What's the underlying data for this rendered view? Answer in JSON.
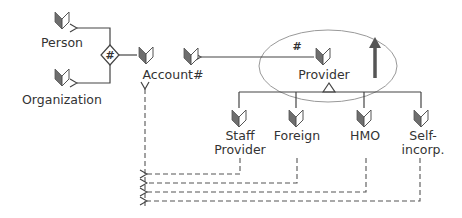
{
  "diagram": {
    "type": "class-hierarchy",
    "colors": {
      "line": "#444444",
      "icon_dark": "#6e6e6e",
      "icon_light": "#ffffff",
      "ellipse": "#888888",
      "text": "#333333"
    },
    "nodes": [
      {
        "id": "person",
        "label": "Person",
        "icon": "book-icon"
      },
      {
        "id": "organization",
        "label": "Organization",
        "icon": "book-icon"
      },
      {
        "id": "account",
        "label": "Account#",
        "icon": "book-icon"
      },
      {
        "id": "unlabeled",
        "label": "",
        "icon": "book-icon"
      },
      {
        "id": "provider",
        "label": "Provider",
        "icon": "book-icon"
      },
      {
        "id": "staff_provider",
        "label_line1": "Staff",
        "label_line2": "Provider",
        "icon": "book-icon"
      },
      {
        "id": "foreign",
        "label": "Foreign",
        "icon": "book-icon"
      },
      {
        "id": "hmo",
        "label": "HMO",
        "icon": "book-icon"
      },
      {
        "id": "self_incorp",
        "label_line1": "Self-",
        "label_line2": "incorp.",
        "icon": "book-icon"
      }
    ],
    "markers": {
      "diamond_hash": "#",
      "provider_hash": "#"
    },
    "edges": [
      {
        "from": "diamond",
        "to": "person",
        "style": "solid-arrow"
      },
      {
        "from": "diamond",
        "to": "organization",
        "style": "solid-arrow"
      },
      {
        "from": "account",
        "to": "diamond",
        "style": "solid"
      },
      {
        "from": "provider",
        "to": "unlabeled",
        "style": "solid-arrow",
        "marker": "#"
      },
      {
        "from": "staff_provider",
        "to": "provider",
        "style": "inheritance"
      },
      {
        "from": "foreign",
        "to": "provider",
        "style": "inheritance"
      },
      {
        "from": "hmo",
        "to": "provider",
        "style": "inheritance"
      },
      {
        "from": "self_incorp",
        "to": "provider",
        "style": "inheritance"
      },
      {
        "from": "staff_provider",
        "to": "account",
        "style": "dashed-arrow"
      },
      {
        "from": "foreign",
        "to": "account",
        "style": "dashed-arrow"
      },
      {
        "from": "hmo",
        "to": "account",
        "style": "dashed-arrow"
      },
      {
        "from": "self_incorp",
        "to": "account",
        "style": "dashed-arrow"
      }
    ],
    "highlight": {
      "target": "provider",
      "shape": "ellipse",
      "indicator": "up-arrow"
    }
  }
}
